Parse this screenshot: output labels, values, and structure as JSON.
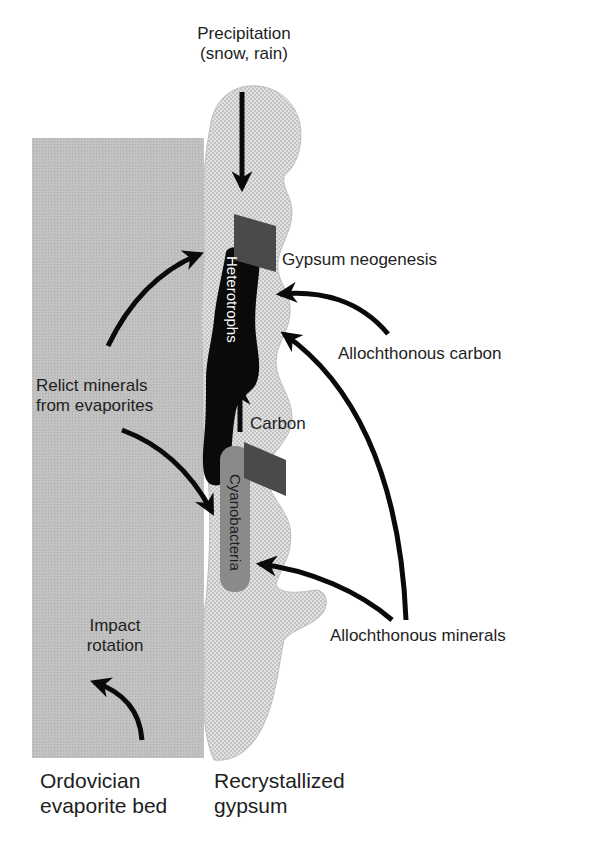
{
  "diagram": {
    "colors": {
      "evaporite_bed": "#bdbdbd",
      "gypsum": "#dcdcdc",
      "heterotrophs": "#0a0a0a",
      "cyanobacteria": "#8a8a8a",
      "gypsum_neogenesis_block": "#4a4a4a",
      "arrow": "#0a0a0a",
      "text": "#1e1e1e"
    },
    "labels": {
      "precipitation_line1": "Precipitation",
      "precipitation_line2": "(snow, rain)",
      "gypsum_neogenesis": "Gypsum neogenesis",
      "heterotrophs": "Heterotrophs",
      "allochthonous_carbon": "Allochthonous carbon",
      "relict_minerals_line1": "Relict minerals",
      "relict_minerals_line2": "from evaporites",
      "carbon": "Carbon",
      "cyanobacteria": "Cyanobacteria",
      "allochthonous_minerals": "Allochthonous minerals",
      "impact_line1": "Impact",
      "impact_line2": "rotation",
      "ordovician_line1": "Ordovician",
      "ordovician_line2": "evaporite bed",
      "recrystallized_line1": "Recrystallized",
      "recrystallized_line2": "gypsum"
    }
  }
}
